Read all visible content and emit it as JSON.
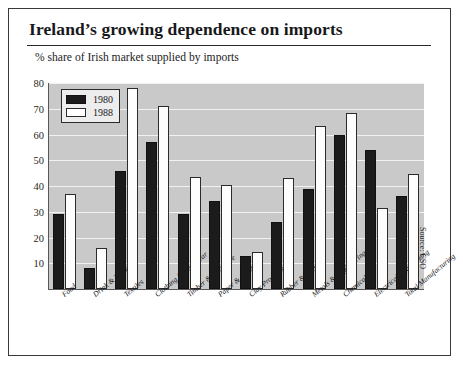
{
  "card": {
    "title": "Ireland’s growing dependence on imports",
    "subtitle": "% share of Irish market supplied by imports",
    "source_note": "Source: CSO"
  },
  "legend": {
    "position": "top-left",
    "entries": [
      {
        "label": "1980",
        "color": "#1b1b1b",
        "icon": "filled-square-swatch"
      },
      {
        "label": "1988",
        "color": "#ffffff",
        "icon": "empty-square-swatch"
      }
    ]
  },
  "chart_data": {
    "type": "bar",
    "title": "Ireland’s growing dependence on imports",
    "subtitle": "% share of Irish market supplied by imports",
    "xlabel": "",
    "ylabel": "",
    "ylim": [
      0,
      80
    ],
    "yticks": [
      0,
      10,
      20,
      30,
      40,
      50,
      60,
      70,
      80
    ],
    "ytick_labels": [
      "",
      "10",
      "20",
      "30",
      "40",
      "50",
      "60",
      "70",
      "80"
    ],
    "grid": true,
    "grid_axis": "y",
    "plot_background": "#c9c9c9",
    "categories": [
      "Food",
      "Drink & Tobacco",
      "Textiles",
      "Clothing & Footwear",
      "Timber & Furniture",
      "Paper & Print",
      "Clay Products",
      "Rubber & Plastics",
      "Metals & Engineering",
      "Chemicals",
      "Electrical Engineering",
      "Total Manufacturing"
    ],
    "series": [
      {
        "name": "1980",
        "color": "#1b1b1b",
        "values": [
          29,
          8,
          46,
          57,
          29,
          34,
          13,
          26,
          39,
          60,
          54,
          36
        ]
      },
      {
        "name": "1988",
        "color": "#ffffff",
        "values": [
          37,
          16,
          78,
          71,
          43.5,
          40.5,
          14.5,
          43,
          63.5,
          68.5,
          31.5,
          44.5
        ]
      }
    ]
  }
}
